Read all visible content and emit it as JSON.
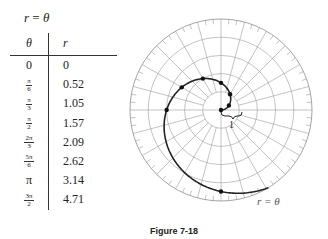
{
  "title": {
    "lhs": "r",
    "op": " = ",
    "rhs": "θ"
  },
  "table": {
    "headers": [
      "θ",
      "r"
    ],
    "rows": [
      {
        "theta_num": "0",
        "theta_den": "",
        "r": "0"
      },
      {
        "theta_num": "π",
        "theta_den": "6",
        "r": "0.52"
      },
      {
        "theta_num": "π",
        "theta_den": "3",
        "r": "1.05"
      },
      {
        "theta_num": "π",
        "theta_den": "2",
        "r": "1.57"
      },
      {
        "theta_num": "2π",
        "theta_den": "3",
        "r": "2.09"
      },
      {
        "theta_num": "5π",
        "theta_den": "6",
        "r": "2.62"
      },
      {
        "theta_num": "π",
        "theta_den": "",
        "r": "3.14"
      },
      {
        "theta_num": "3π",
        "theta_den": "2",
        "r": "4.71"
      }
    ]
  },
  "plot": {
    "curve_label": "r = θ",
    "unit_label": "1",
    "rings": 5,
    "spokes_deg": 15,
    "colors": {
      "grid": "#9a9a9a",
      "curve": "#222222"
    }
  },
  "caption": "Figure 7-18"
}
